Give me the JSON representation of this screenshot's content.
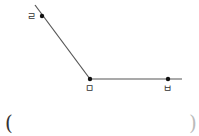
{
  "diagram": {
    "stroke_color": "#555555",
    "point_color": "#111111",
    "segments": [
      {
        "from": [
          35,
          5
        ],
        "to": [
          90,
          79
        ]
      },
      {
        "from": [
          90,
          79
        ],
        "to": [
          182,
          79
        ]
      }
    ],
    "points": [
      {
        "label": "ㄹ",
        "x": 42,
        "y": 16,
        "label_x": 27,
        "label_y": 20
      },
      {
        "label": "ㅁ",
        "x": 90,
        "y": 79,
        "label_x": 85,
        "label_y": 92
      },
      {
        "label": "ㅂ",
        "x": 168,
        "y": 79,
        "label_x": 163,
        "label_y": 92
      }
    ]
  },
  "answer_blank": {
    "open": "(",
    "close": ")"
  }
}
